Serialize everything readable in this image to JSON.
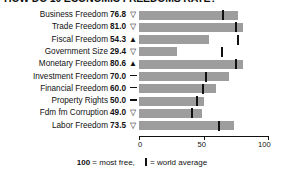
{
  "title": "HOW DO 10 ECONOMIC FREEDOMS RATE?",
  "axis": {
    "ticks": [
      "0",
      "50",
      "100"
    ],
    "min": 0,
    "max": 100
  },
  "footer": {
    "most_free": "100",
    "most_free_text": " = most free,",
    "world_average_text": " = world average"
  },
  "chart_data": {
    "type": "bar",
    "title": "HOW DO 10 ECONOMIC FREEDOMS RATE?",
    "xlabel": "",
    "ylabel": "",
    "xlim": [
      0,
      100
    ],
    "grid": false,
    "orientation": "horizontal",
    "legend": "100 = most free, | = world average",
    "categories": [
      "Business Freedom",
      "Trade Freedom",
      "Fiscal Freedom",
      "Government Size",
      "Monetary Freedom",
      "Investment Freedom",
      "Financial Freedom",
      "Property Rights",
      "Fdm fm Corruption",
      "Labor Freedom"
    ],
    "values": [
      76.8,
      81.0,
      54.3,
      29.4,
      80.6,
      70.0,
      60.0,
      50.0,
      49.0,
      73.5
    ],
    "value_labels": [
      "76.8",
      "81.0",
      "54.3",
      "29.4",
      "80.6",
      "70.0",
      "60.0",
      "50.0",
      "49.0",
      "73.5"
    ],
    "trends": [
      "down",
      "down",
      "up",
      "down",
      "up",
      "flat",
      "flat",
      "flat",
      "down",
      "down"
    ],
    "world_average": [
      64.3,
      74.8,
      76.3,
      63.9,
      74.4,
      50.9,
      48.5,
      43.8,
      40.5,
      61.5
    ],
    "series": [
      {
        "name": "Country score",
        "values": [
          76.8,
          81.0,
          54.3,
          29.4,
          80.6,
          70.0,
          60.0,
          50.0,
          49.0,
          73.5
        ]
      },
      {
        "name": "World average",
        "values": [
          64.3,
          74.8,
          76.3,
          63.9,
          74.4,
          50.9,
          48.5,
          43.8,
          40.5,
          61.5
        ]
      }
    ]
  },
  "colors": {
    "bar": "#9d9d9d",
    "tick": "#111111",
    "text": "#111111"
  }
}
